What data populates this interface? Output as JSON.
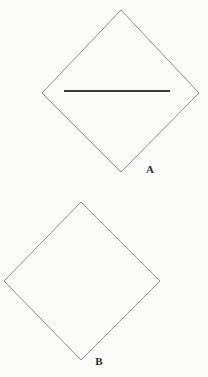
{
  "canvas": {
    "width": 208,
    "height": 377,
    "background_color": "#fbfbf9"
  },
  "style": {
    "outline_color": "#8d8d8d",
    "outline_width": 1,
    "chord_color": "#3a3a3a",
    "chord_width": 2.1,
    "label_color": "#2e2e2e",
    "label_font_size": 11
  },
  "figures": [
    {
      "id": "figure-a",
      "label": "A",
      "shape": "diamond",
      "label_position": {
        "x": 150,
        "y": 173
      },
      "vertices": {
        "top": {
          "x": 121,
          "y": 10
        },
        "right": {
          "x": 199,
          "y": 93
        },
        "bottom": {
          "x": 121,
          "y": 172
        },
        "left": {
          "x": 42,
          "y": 93
        }
      },
      "points": "121,10 199,93 121,172 42,93",
      "inner_line": {
        "present": true,
        "orientation": "horizontal",
        "x1": 64,
        "y1": 91,
        "x2": 170,
        "y2": 91
      }
    },
    {
      "id": "figure-b",
      "label": "B",
      "shape": "diamond",
      "label_position": {
        "x": 99,
        "y": 365
      },
      "vertices": {
        "top": {
          "x": 81,
          "y": 202
        },
        "right": {
          "x": 160,
          "y": 281
        },
        "bottom": {
          "x": 81,
          "y": 360
        },
        "left": {
          "x": 4,
          "y": 281
        }
      },
      "points": "81,202 160,281 81,360 4,281",
      "inner_line": {
        "present": false
      }
    }
  ]
}
